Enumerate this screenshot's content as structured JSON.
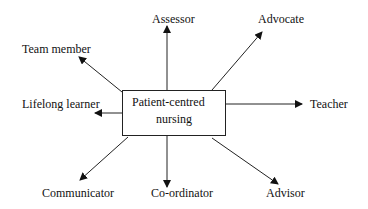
{
  "diagram": {
    "center": {
      "line1": "Patient-centred",
      "line2": "nursing"
    },
    "roles": [
      {
        "id": "assessor",
        "label": "Assessor"
      },
      {
        "id": "advocate",
        "label": "Advocate"
      },
      {
        "id": "team-member",
        "label": "Team member"
      },
      {
        "id": "lifelong-learner",
        "label": "Lifelong learner"
      },
      {
        "id": "teacher",
        "label": "Teacher"
      },
      {
        "id": "communicator",
        "label": "Communicator"
      },
      {
        "id": "co-ordinator",
        "label": "Co-ordinator"
      },
      {
        "id": "advisor",
        "label": "Advisor"
      }
    ],
    "colors": {
      "line": "#222222",
      "text": "#111111",
      "background": "#ffffff"
    }
  }
}
